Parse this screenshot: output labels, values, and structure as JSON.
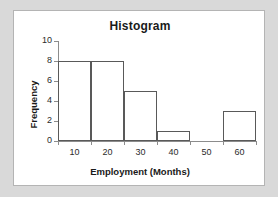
{
  "chart_data": {
    "type": "bar",
    "title": "Histogram",
    "xlabel": "Employment (Months)",
    "ylabel": "Frequency",
    "grid": false,
    "legend": "none",
    "xlim": [
      5,
      65
    ],
    "ylim": [
      0,
      10
    ],
    "xticks": [
      5,
      15,
      25,
      35,
      45,
      55,
      65
    ],
    "xtick_labels": [
      "10",
      "20",
      "30",
      "40",
      "50",
      "60"
    ],
    "xtick_label_centers": [
      10,
      20,
      30,
      40,
      50,
      60
    ],
    "yticks": [
      0,
      2,
      4,
      6,
      8,
      10
    ],
    "ytick_labels": [
      "0",
      "2",
      "4",
      "6",
      "8",
      "10"
    ],
    "bin_edges": [
      5,
      15,
      25,
      35,
      45,
      55,
      65
    ],
    "categories": [
      "5-15",
      "15-25",
      "25-35",
      "35-45",
      "45-55",
      "55-65"
    ],
    "values": [
      8,
      8,
      5,
      1,
      0,
      3
    ],
    "bar_fill": "#ffffff",
    "bar_edge": "#595959",
    "axis_color": "#8c8c8c",
    "panel_background": "#ffffff",
    "page_background": "#d9d9d9"
  }
}
